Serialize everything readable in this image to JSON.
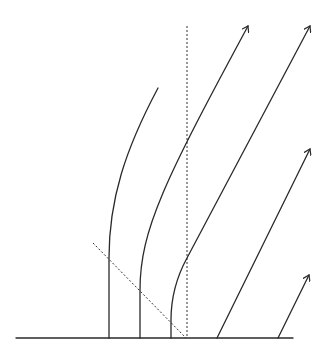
{
  "diagram": {
    "type": "worldline-diagram",
    "colors": {
      "ink": "#2a2a2a",
      "background": "#ffffff"
    },
    "baseline": {
      "x1": 16,
      "y1": 338,
      "x2": 293,
      "y2": 338
    },
    "dotted_vertical": {
      "x1": 187,
      "y1": 26,
      "x2": 187,
      "y2": 338
    },
    "dashed_diagonal": {
      "x1": 93,
      "y1": 243,
      "x2": 186,
      "y2": 338
    },
    "worldlines": [
      {
        "id": "w1",
        "path": "M109,338 L109,258 C109,200 125,150 158,88",
        "arrow": false
      },
      {
        "id": "w2",
        "path": "M140,338 L140,290 C140,230 165,180 248,26",
        "arrow": true
      },
      {
        "id": "w3",
        "path": "M171,338 L171,320 C171,300 175,280 187,258 L310,26",
        "arrow": true
      },
      {
        "id": "w4",
        "path": "M217,338 L310,149",
        "arrow": true
      },
      {
        "id": "w5",
        "path": "M278,338 L309,275",
        "arrow": true
      }
    ]
  }
}
